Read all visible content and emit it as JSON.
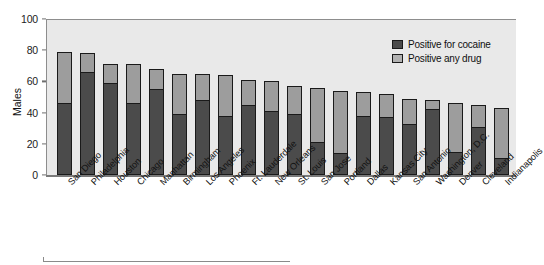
{
  "chart_data": {
    "type": "bar",
    "subtype": "stacked-vertical",
    "title": "",
    "xlabel": "",
    "ylabel": "Males",
    "ylim": [
      0,
      100
    ],
    "yticks": [
      0,
      20,
      40,
      60,
      80,
      100
    ],
    "grid": false,
    "legend_position": "top-right",
    "categories": [
      "San Diego",
      "Philadelphia",
      "Houston",
      "Chicago",
      "Manhattan",
      "Birmingham",
      "Los Angeles",
      "Phoenix",
      "Ft. Lauderdale",
      "New Orleans",
      "St. Louis",
      "San Jose",
      "Portland",
      "Dallas",
      "Kansas City",
      "San Antonio",
      "Washington, D.C.",
      "Denver",
      "Cleveland",
      "Indianapolis"
    ],
    "series": [
      {
        "name": "Positive for cocaine",
        "color": "#4b4b4b",
        "values": [
          46,
          66,
          59,
          46,
          55,
          39,
          48,
          38,
          45,
          41,
          39,
          21,
          14,
          38,
          37,
          33,
          42,
          15,
          31,
          11
        ]
      },
      {
        "name": "Positive any drug",
        "color": "#9d9d9d",
        "values": [
          79,
          78,
          71,
          71,
          68,
          65,
          65,
          64,
          61,
          60,
          57,
          56,
          54,
          53,
          52,
          49,
          48,
          46,
          45,
          43
        ]
      }
    ]
  },
  "axes": {
    "y_title": "Males",
    "tick_labels": [
      "0",
      "20",
      "40",
      "60",
      "80",
      "100"
    ]
  },
  "legend": {
    "items": [
      {
        "label": "Positive for cocaine",
        "color": "#4b4b4b"
      },
      {
        "label": "Positive any drug",
        "color": "#b2b2b2"
      }
    ]
  },
  "colors": {
    "cocaine": "#4b4b4b",
    "any_drug": "#9d9d9d",
    "plot_background": "#e9e9e9",
    "axis": "#1a1a1a"
  }
}
